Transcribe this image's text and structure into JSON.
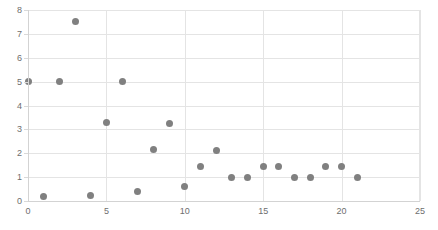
{
  "chart_data": {
    "type": "scatter",
    "title": "",
    "xlabel": "",
    "ylabel": "",
    "xlim": [
      0,
      25
    ],
    "ylim": [
      0,
      8
    ],
    "xticks": [
      0,
      5,
      10,
      15,
      20,
      25
    ],
    "yticks": [
      0,
      1,
      2,
      3,
      4,
      5,
      6,
      7,
      8
    ],
    "xtick_labels": [
      "0",
      "5",
      "10",
      "15",
      "20",
      "25"
    ],
    "ytick_labels": [
      "0",
      "1",
      "2",
      "3",
      "4",
      "5",
      "6",
      "7",
      "8"
    ],
    "grid": true,
    "legend": false,
    "marker_color": "#808080",
    "marker_shape": "circle",
    "series": [
      {
        "name": "series-1",
        "points": [
          {
            "x": 0,
            "y": 5.0
          },
          {
            "x": 1,
            "y": 0.2
          },
          {
            "x": 2,
            "y": 5.0
          },
          {
            "x": 3,
            "y": 7.5
          },
          {
            "x": 4,
            "y": 0.25
          },
          {
            "x": 5,
            "y": 3.3
          },
          {
            "x": 6,
            "y": 5.0
          },
          {
            "x": 7,
            "y": 0.4
          },
          {
            "x": 8,
            "y": 2.15
          },
          {
            "x": 9,
            "y": 3.25
          },
          {
            "x": 10,
            "y": 0.6
          },
          {
            "x": 11,
            "y": 1.45
          },
          {
            "x": 12,
            "y": 2.1
          },
          {
            "x": 13,
            "y": 1.0
          },
          {
            "x": 14,
            "y": 1.0
          },
          {
            "x": 15,
            "y": 1.45
          },
          {
            "x": 16,
            "y": 1.45
          },
          {
            "x": 17,
            "y": 1.0
          },
          {
            "x": 18,
            "y": 1.0
          },
          {
            "x": 19,
            "y": 1.45
          },
          {
            "x": 20,
            "y": 1.45
          },
          {
            "x": 21,
            "y": 1.0
          }
        ]
      }
    ]
  }
}
